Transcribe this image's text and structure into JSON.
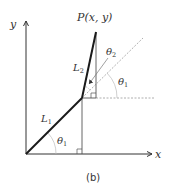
{
  "figure": {
    "caption": "(b)",
    "colors": {
      "links": "#1a1a1a",
      "axes": "#333333",
      "guides": "#555555",
      "dashed": "#9a9a9a",
      "background": "#ffffff"
    }
  },
  "axes": {
    "x_label": "x",
    "y_label": "y"
  },
  "points": {
    "end_effector_label": "P(x, y)"
  },
  "links": [
    {
      "name": "L1",
      "label_main": "L",
      "label_sub": "1"
    },
    {
      "name": "L2",
      "label_main": "L",
      "label_sub": "2"
    }
  ],
  "angles": [
    {
      "name": "theta1_base",
      "label_main": "θ",
      "label_sub": "1"
    },
    {
      "name": "theta2",
      "label_main": "θ",
      "label_sub": "2"
    },
    {
      "name": "theta1_joint",
      "label_main": "θ",
      "label_sub": "1"
    }
  ]
}
